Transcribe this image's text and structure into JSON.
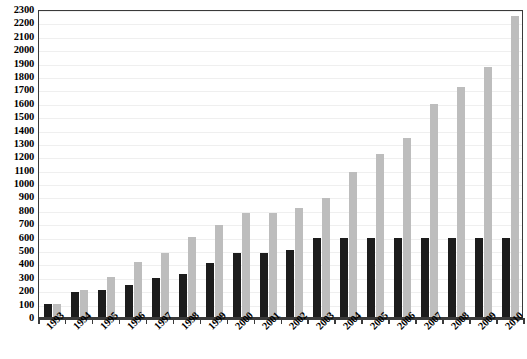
{
  "chart_data": {
    "type": "bar",
    "title": "",
    "subtitle": "",
    "xlabel": "",
    "ylabel": "",
    "ylim": [
      0,
      2300
    ],
    "ytick_step": 100,
    "grid": true,
    "legend": "none",
    "orientation": "vertical",
    "bar_mode": "grouped",
    "categories": [
      "1993",
      "1994",
      "1995",
      "1996",
      "1997",
      "1998",
      "1999",
      "2000",
      "2001",
      "2002",
      "2003",
      "2004",
      "2005",
      "2006",
      "2007",
      "2008",
      "2009",
      "2010"
    ],
    "series": [
      {
        "name": "series-black",
        "color": "#1c1c1c",
        "values": [
          100,
          190,
          205,
          240,
          295,
          320,
          400,
          480,
          480,
          500,
          590,
          590,
          590,
          590,
          590,
          590,
          590,
          590
        ]
      },
      {
        "name": "series-gray",
        "color": "#bdbdbd",
        "values": [
          100,
          205,
          300,
          410,
          480,
          600,
          690,
          775,
          775,
          815,
          890,
          1080,
          1215,
          1335,
          1590,
          1720,
          1870,
          2250
        ]
      }
    ],
    "ytick_labels": [
      "0",
      "100",
      "200",
      "300",
      "400",
      "500",
      "600",
      "700",
      "800",
      "900",
      "1000",
      "1100",
      "1200",
      "1300",
      "1400",
      "1500",
      "1600",
      "1700",
      "1800",
      "1900",
      "2000",
      "2100",
      "2200",
      "2300"
    ]
  },
  "style": {
    "plot_border_color": "#3a3a3a",
    "gridline_color": "#efefef",
    "background_color": "#ffffff",
    "text_color": "#000000"
  }
}
